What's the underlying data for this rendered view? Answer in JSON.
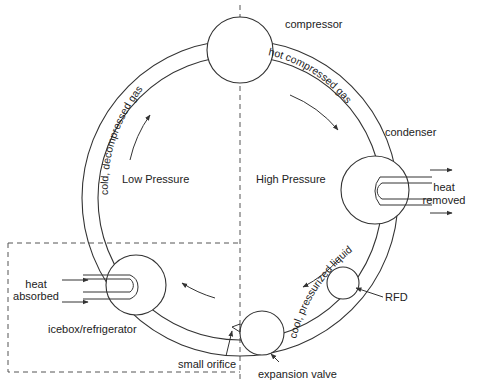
{
  "diagram": {
    "regions": {
      "low_pressure": "Low Pressure",
      "high_pressure": "High Pressure",
      "icebox": "icebox/refrigerator"
    },
    "components": {
      "compressor": "compressor",
      "condenser": "condenser",
      "rfd": "RFD",
      "expansion_valve": "expansion valve",
      "small_orifice": "small orifice"
    },
    "pipe_labels": {
      "hot_gas": "hot compressed gas",
      "cool_liquid": "cool, pressurized liquid",
      "cold_gas": "cold, decompressed gas"
    },
    "heat": {
      "removed_line1": "heat",
      "removed_line2": "removed",
      "absorbed_line1": "heat",
      "absorbed_line2": "absorbed"
    },
    "colors": {
      "line": "#333333",
      "background": "#ffffff"
    }
  }
}
